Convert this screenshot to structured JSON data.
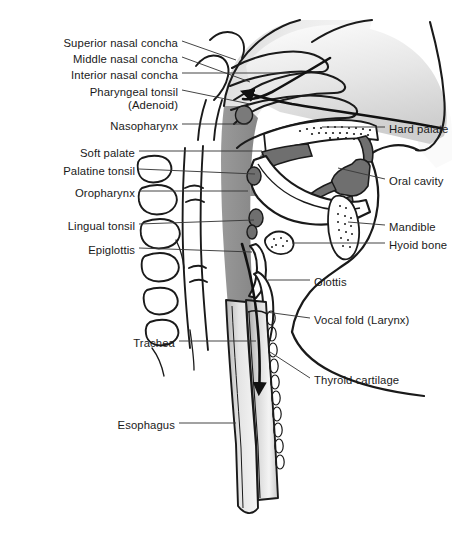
{
  "figure": {
    "background_color": "#ffffff",
    "line_color": "#1a1a1a",
    "palette": {
      "pharynx_gray": "#8d8d8d",
      "dark_gray": "#6f6f6f",
      "light_gray": "#d9d9d9",
      "pale_gray": "#f1f1f1",
      "outline": "#1a1a1a",
      "leader_line": "#4a4a4a"
    }
  },
  "labels_left": [
    {
      "id": "superior-nasal-concha",
      "text": "Superior nasal concha",
      "x": 178,
      "y": 44,
      "leader": [
        [
          182,
          42
        ],
        [
          233,
          59
        ]
      ]
    },
    {
      "id": "middle-nasal-concha",
      "text": "Middle nasal concha",
      "x": 178,
      "y": 60,
      "leader": [
        [
          182,
          58
        ],
        [
          246,
          80
        ]
      ]
    },
    {
      "id": "interior-nasal-concha",
      "text": "Interior nasal concha",
      "x": 178,
      "y": 76,
      "leader": [
        [
          182,
          74
        ],
        [
          286,
          74
        ]
      ]
    },
    {
      "id": "pharyngeal-tonsil",
      "text": "Pharyngeal tonsil",
      "x": 178,
      "y": 94,
      "leader": [
        [
          182,
          92
        ],
        [
          262,
          92
        ]
      ]
    },
    {
      "id": "adenoid",
      "text": "(Adenoid)",
      "x": 178,
      "y": 107,
      "leader": null
    },
    {
      "id": "nasopharynx",
      "text": "Nasopharynx",
      "x": 178,
      "y": 128,
      "leader": [
        [
          182,
          126
        ],
        [
          258,
          126
        ]
      ]
    },
    {
      "id": "soft-palate",
      "text": "Soft palate",
      "x": 135,
      "y": 155,
      "leader": [
        [
          139,
          153
        ],
        [
          250,
          153
        ]
      ]
    },
    {
      "id": "palatine-tonsil",
      "text": "Palatine tonsil",
      "x": 135,
      "y": 173,
      "leader": [
        [
          139,
          171
        ],
        [
          262,
          171
        ]
      ]
    },
    {
      "id": "oropharynx",
      "text": "Oropharynx",
      "x": 135,
      "y": 195,
      "leader": [
        [
          139,
          193
        ],
        [
          250,
          193
        ]
      ]
    },
    {
      "id": "lingual-tonsil",
      "text": "Lingual tonsil",
      "x": 135,
      "y": 228,
      "leader": [
        [
          139,
          226
        ],
        [
          262,
          226
        ]
      ]
    },
    {
      "id": "epiglottis",
      "text": "Epiglottis",
      "x": 135,
      "y": 252,
      "leader": [
        [
          139,
          250
        ],
        [
          252,
          250
        ]
      ]
    },
    {
      "id": "trachea",
      "text": "Trachea",
      "x": 175,
      "y": 345,
      "leader": [
        [
          179,
          343
        ],
        [
          258,
          343
        ]
      ]
    },
    {
      "id": "esophagus",
      "text": "Esophagus",
      "x": 175,
      "y": 427,
      "leader": [
        [
          179,
          425
        ],
        [
          250,
          425
        ]
      ]
    }
  ],
  "labels_right": [
    {
      "id": "hard-palate",
      "text": "Hard palate",
      "x": 389,
      "y": 131,
      "leader": [
        [
          385,
          129
        ],
        [
          330,
          129
        ]
      ]
    },
    {
      "id": "oral-cavity",
      "text": "Oral cavity",
      "x": 389,
      "y": 183,
      "leader": [
        [
          385,
          181
        ],
        [
          330,
          181
        ]
      ]
    },
    {
      "id": "mandible",
      "text": "Mandible",
      "x": 389,
      "y": 229,
      "leader": [
        [
          385,
          227
        ],
        [
          338,
          227
        ]
      ]
    },
    {
      "id": "hyoid-bone",
      "text": "Hyoid bone",
      "x": 389,
      "y": 247,
      "leader": [
        [
          385,
          245
        ],
        [
          298,
          245
        ]
      ]
    },
    {
      "id": "glottis",
      "text": "Glottis",
      "x": 314,
      "y": 284,
      "leader": [
        [
          310,
          282
        ],
        [
          272,
          282
        ]
      ]
    },
    {
      "id": "vocal-fold",
      "text": "Vocal fold (Larynx)",
      "x": 314,
      "y": 322,
      "leader": [
        [
          310,
          320
        ],
        [
          272,
          320
        ]
      ]
    },
    {
      "id": "thyroid-cartilage",
      "text": "Thyroid cartilage",
      "x": 314,
      "y": 382,
      "leader": [
        [
          310,
          380
        ],
        [
          268,
          356
        ]
      ]
    }
  ],
  "structures": [
    {
      "name": "nasal-cavity",
      "fill": "light-gradient"
    },
    {
      "name": "superior-concha",
      "fill": "none"
    },
    {
      "name": "middle-concha",
      "fill": "none"
    },
    {
      "name": "inferior-concha",
      "fill": "none"
    },
    {
      "name": "pharynx",
      "fill": "#8d8d8d"
    },
    {
      "name": "hard-palate",
      "fill": "#ffffff"
    },
    {
      "name": "soft-palate",
      "fill": "#6f6f6f"
    },
    {
      "name": "tongue",
      "fill": "#ffffff"
    },
    {
      "name": "mandible",
      "fill": "#ffffff"
    },
    {
      "name": "hyoid-bone",
      "fill": "#ffffff"
    },
    {
      "name": "epiglottis",
      "fill": "#ffffff"
    },
    {
      "name": "thyroid-cartilage",
      "fill": "#ffffff"
    },
    {
      "name": "trachea",
      "fill": "gradient"
    },
    {
      "name": "esophagus",
      "fill": "gradient"
    },
    {
      "name": "vertebrae",
      "fill": "#ffffff",
      "count": 6
    },
    {
      "name": "airflow-arrow",
      "fill": "#111111"
    }
  ]
}
